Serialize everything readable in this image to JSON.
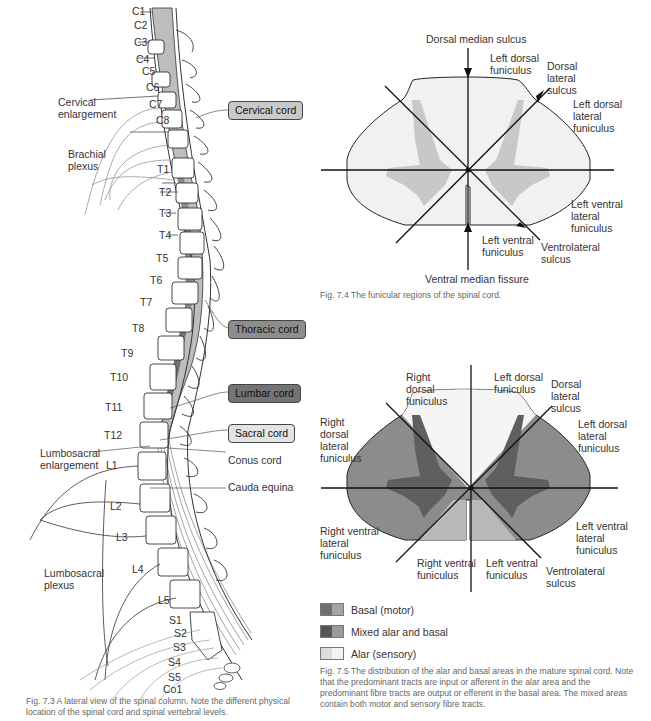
{
  "figure_7_3": {
    "caption": "Fig. 7.3 A lateral view of the spinal column. Note the different physical location of the spinal cord and spinal vertebral levels.",
    "spinal_nerve_labels": [
      "C1",
      "C2",
      "C3",
      "C4",
      "C5",
      "C6",
      "C7",
      "C8",
      "T1",
      "T2",
      "T3",
      "T4",
      "T5",
      "T6",
      "T7",
      "T8",
      "T9",
      "T10",
      "T11",
      "T12",
      "L1",
      "L2",
      "L3",
      "L4",
      "L5",
      "S1",
      "S2",
      "S3",
      "S4",
      "S5",
      "Co1"
    ],
    "vertebra_labels": [
      "C2",
      "C3",
      "C4",
      "C5",
      "C6",
      "C7",
      "T1",
      "T2",
      "T3",
      "T4",
      "T5",
      "T6",
      "T7",
      "T8",
      "T9",
      "T10",
      "T11",
      "T12",
      "L1",
      "L2",
      "L3",
      "L4",
      "L5",
      "S"
    ],
    "region_labels": {
      "cervical_enlargement": "Cervical enlargement",
      "brachial_plexus": "Brachial plexus",
      "lumbosacral_enlargement": "Lumbosacral enlargement",
      "lumbosacral_plexus": "Lumbosacral plexus",
      "conus_cord": "Conus cord",
      "cauda_equina": "Cauda equina"
    },
    "cord_boxes": [
      {
        "label": "Cervical cord",
        "color": "#c9c9c9"
      },
      {
        "label": "Thoracic cord",
        "color": "#8d8d8d"
      },
      {
        "label": "Lumbar cord",
        "color": "#747474"
      },
      {
        "label": "Sacral cord",
        "color": "#e4e4e4"
      }
    ]
  },
  "figure_7_4": {
    "caption": "Fig. 7.4 The funicular regions of the spinal cord.",
    "labels": {
      "dorsal_median_sulcus": "Dorsal median sulcus",
      "left_dorsal_funiculus": "Left dorsal funiculus",
      "dorsal_lateral_sulcus": "Dorsal lateral sulcus",
      "left_dorsal_lateral_funiculus": "Left dorsal lateral funiculus",
      "left_ventral_lateral_funiculus": "Left ventral lateral funiculus",
      "ventrolateral_sulcus": "Ventrolateral sulcus",
      "left_ventral_funiculus": "Left ventral funiculus",
      "ventral_median_fissure": "Ventral median fissure"
    }
  },
  "figure_7_5": {
    "caption": "Fig. 7.5 The distribution of the alar and basal areas in the mature spinal cord. Note that the predominant tracts are input or afferent in the alar area and the predominant fibre tracts are output or efferent in the basal area. The mixed areas contain both motor and sensory fibre tracts.",
    "labels": {
      "right_dorsal_funiculus": "Right dorsal funiculus",
      "left_dorsal_funiculus": "Left dorsal funiculus",
      "dorsal_lateral_sulcus": "Dorsal lateral sulcus",
      "right_dorsal_lateral_funiculus": "Right dorsal lateral funiculus",
      "left_dorsal_lateral_funiculus": "Left dorsal lateral funiculus",
      "right_ventral_lateral_funiculus": "Right ventral lateral funiculus",
      "left_ventral_lateral_funiculus": "Left ventral lateral funiculus",
      "right_ventral_funiculus": "Right ventral funiculus",
      "left_ventral_funiculus": "Left ventral funiculus",
      "ventrolateral_sulcus": "Ventrolateral sulcus"
    },
    "legend": [
      {
        "label": "Basal (motor)",
        "colors": [
          "#6f6f6f",
          "#a4a4a4"
        ]
      },
      {
        "label": "Mixed alar and basal",
        "colors": [
          "#555555",
          "#9a9a9a"
        ]
      },
      {
        "label": "Alar (sensory)",
        "colors": [
          "#dcdcdc",
          "#f3f3f3"
        ]
      }
    ]
  }
}
